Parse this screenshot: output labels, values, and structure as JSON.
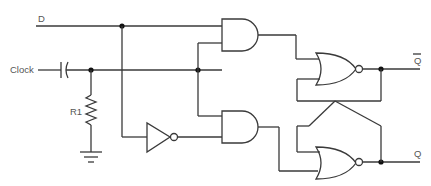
{
  "labels": {
    "d": "D",
    "clock": "Clock",
    "r1": "R1",
    "q_bar": "Q",
    "q": "Q"
  },
  "components": [
    {
      "id": "c-clock",
      "type": "capacitor"
    },
    {
      "id": "r1",
      "type": "resistor",
      "label": "R1"
    },
    {
      "id": "gnd",
      "type": "ground"
    },
    {
      "id": "inv1",
      "type": "NOT"
    },
    {
      "id": "and-top",
      "type": "AND"
    },
    {
      "id": "and-bottom",
      "type": "AND"
    },
    {
      "id": "nor-top",
      "type": "NOR"
    },
    {
      "id": "nor-bottom",
      "type": "NOR"
    }
  ],
  "outputs": [
    "Q-bar",
    "Q"
  ],
  "inputs": [
    "D",
    "Clock"
  ]
}
